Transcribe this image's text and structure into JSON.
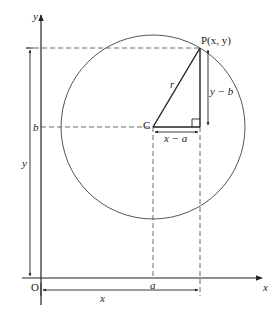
{
  "diagram": {
    "points": {
      "origin": {
        "label": "O",
        "px": [
          41,
          278
        ]
      },
      "center": {
        "label": "C",
        "px": [
          153,
          127
        ]
      },
      "point": {
        "label": "P(x, y)",
        "px": [
          200,
          48
        ]
      }
    },
    "axes": {
      "x_label": "x",
      "y_label": "y"
    },
    "labels": {
      "radius": "r",
      "horizontal_leg": "x − a",
      "vertical_leg": "y − b",
      "b_tick": "b",
      "a_tick": "a",
      "y_span": "y",
      "x_span": "x"
    },
    "colors": {
      "stroke": "#222222",
      "circle": "#555555",
      "dashed": "#444444"
    }
  }
}
